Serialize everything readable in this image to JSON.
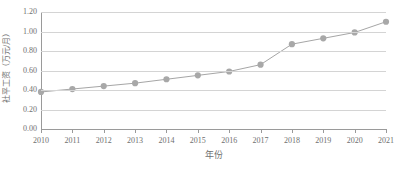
{
  "chart_data": {
    "type": "line",
    "title": "",
    "subtitle": "",
    "xlabel": "年份",
    "ylabel": "社平工资（万元/月）",
    "categories": [
      "2010",
      "2011",
      "2012",
      "2013",
      "2014",
      "2015",
      "2016",
      "2017",
      "2018",
      "2019",
      "2020",
      "2021"
    ],
    "values": [
      0.38,
      0.41,
      0.44,
      0.47,
      0.51,
      0.55,
      0.59,
      0.66,
      0.87,
      0.93,
      0.99,
      1.1
    ],
    "series": [
      {
        "name": "社平工资",
        "values": [
          0.38,
          0.41,
          0.44,
          0.47,
          0.51,
          0.55,
          0.59,
          0.66,
          0.87,
          0.93,
          0.99,
          1.1
        ]
      }
    ],
    "ylim": [
      0.0,
      1.2
    ],
    "ytick_labels": [
      "0.00",
      "0.20",
      "0.40",
      "0.60",
      "0.80",
      "1.00",
      "1.20"
    ],
    "ytick_values": [
      0.0,
      0.2,
      0.4,
      0.6,
      0.8,
      1.0,
      1.2
    ],
    "grid": true,
    "grid_axis": "y",
    "legend": false,
    "legend_position": "none",
    "marker": "circle",
    "line_color": "#a6a6a6",
    "marker_color": "#a8a8a8",
    "grid_color": "#d4d4d4",
    "axis_color": "#9a9a9a",
    "background_color": "#ffffff"
  },
  "axes": {
    "y_title": "社平工资（万元/月）",
    "x_title": "年份"
  }
}
